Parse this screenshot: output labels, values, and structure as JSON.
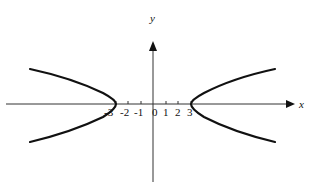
{
  "figure": {
    "type": "hyperbola",
    "axes": {
      "x_label": "x",
      "y_label": "y",
      "x_tick_labels": [
        "-3",
        "-2",
        "-1",
        "0",
        "1",
        "2",
        "3"
      ]
    },
    "curve": {
      "description": "Hyperbola opening left and right with vertices at (-3, 0) and (3, 0)",
      "vertices": [
        [
          -3,
          0
        ],
        [
          3,
          0
        ]
      ],
      "color": "#111111"
    }
  }
}
